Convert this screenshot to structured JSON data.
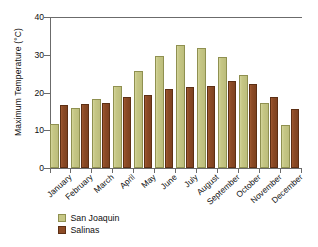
{
  "chart_data": {
    "type": "bar",
    "title": "",
    "xlabel": "",
    "ylabel": "Maximum Temperature (°C)",
    "ylim": [
      0,
      40
    ],
    "yticks": [
      0,
      10,
      20,
      30,
      40
    ],
    "grid": false,
    "legend_position": "bottom-left",
    "categories": [
      "January",
      "February",
      "March",
      "April",
      "May",
      "June",
      "July",
      "August",
      "September",
      "October",
      "November",
      "December"
    ],
    "series": [
      {
        "name": "San Joaquin",
        "color": "#c6c785",
        "values": [
          11.7,
          15.8,
          18.3,
          21.6,
          25.8,
          29.6,
          32.5,
          31.7,
          29.5,
          24.7,
          17.3,
          11.4
        ]
      },
      {
        "name": "Salinas",
        "color": "#8d4b26",
        "values": [
          16.8,
          16.9,
          17.2,
          18.8,
          19.4,
          21.0,
          21.5,
          21.8,
          23.0,
          22.2,
          18.7,
          15.6
        ]
      }
    ]
  },
  "axes": {
    "y_title": "Maximum Temperature (°C)",
    "y_tick_labels": [
      "40",
      "30",
      "20",
      "10",
      "0"
    ],
    "x_tick_labels": [
      "January",
      "February",
      "March",
      "April",
      "May",
      "June",
      "July",
      "August",
      "September",
      "October",
      "November",
      "December"
    ]
  },
  "legend": {
    "items": [
      {
        "label": "San Joaquin",
        "color": "#c6c785"
      },
      {
        "label": "Salinas",
        "color": "#8d4b26"
      }
    ]
  }
}
